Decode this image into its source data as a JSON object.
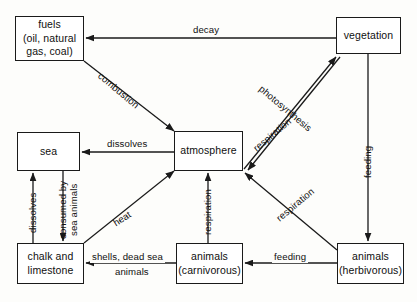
{
  "diagram": {
    "background_color": "#fdfdfb",
    "line_color": "#1a1a1a",
    "nodes": [
      {
        "id": "fuels",
        "lines": [
          "fuels",
          "(oil, natural",
          "gas, coal)"
        ],
        "x": 15,
        "y": 16,
        "w": 69,
        "h": 45
      },
      {
        "id": "vegetation",
        "lines": [
          "vegetation"
        ],
        "x": 336,
        "y": 17,
        "w": 65,
        "h": 37
      },
      {
        "id": "sea",
        "lines": [
          "sea"
        ],
        "x": 17,
        "y": 132,
        "w": 63,
        "h": 39
      },
      {
        "id": "atmosphere",
        "lines": [
          "atmosphere"
        ],
        "x": 174,
        "y": 131,
        "w": 69,
        "h": 40
      },
      {
        "id": "chalk-and-limestone",
        "lines": [
          "chalk and",
          "limestone"
        ],
        "x": 17,
        "y": 243,
        "w": 67,
        "h": 41
      },
      {
        "id": "animals-carnivorous",
        "lines": [
          "animals",
          "(carnivorous)"
        ],
        "x": 176,
        "y": 243,
        "w": 67,
        "h": 41
      },
      {
        "id": "animals-herbivorous",
        "lines": [
          "animals",
          "(herbivorous)"
        ],
        "x": 337,
        "y": 243,
        "w": 67,
        "h": 41
      }
    ],
    "edges": [
      {
        "id": "decay",
        "label": "decay",
        "from": "vegetation",
        "to": "fuels"
      },
      {
        "id": "combustion",
        "label": "combustion",
        "from": "fuels",
        "to": "atmosphere"
      },
      {
        "id": "respiration-vegetation",
        "label": "respiration",
        "from": "atmosphere",
        "to": "vegetation"
      },
      {
        "id": "photosynthesis",
        "label": "photosynthesis",
        "from": "vegetation",
        "to": "atmosphere"
      },
      {
        "id": "feeding-vegetation",
        "label": "feeding",
        "from": "vegetation",
        "to": "animals-herbivorous"
      },
      {
        "id": "dissolves-atmosphere-sea",
        "label": "dissolves",
        "from": "atmosphere",
        "to": "sea"
      },
      {
        "id": "dissolves-chalk-sea",
        "label": "dissolves",
        "from": "chalk-and-limestone",
        "to": "sea"
      },
      {
        "id": "consumed-by-sea-animals",
        "label": "consumed by sea animals",
        "from": "sea",
        "to": "chalk-and-limestone"
      },
      {
        "id": "heat",
        "label": "heat",
        "from": "chalk-and-limestone",
        "to": "atmosphere"
      },
      {
        "id": "respiration-carnivorous",
        "label": "respiration",
        "from": "animals-carnivorous",
        "to": "atmosphere"
      },
      {
        "id": "respiration-herbivorous",
        "label": "respiration",
        "from": "animals-herbivorous",
        "to": "atmosphere"
      },
      {
        "id": "shells-dead-sea-animals",
        "label": "shells, dead sea animals",
        "from": "animals-carnivorous",
        "to": "chalk-and-limestone"
      },
      {
        "id": "feeding-herbivorous",
        "label": "feeding",
        "from": "animals-herbivorous",
        "to": "animals-carnivorous"
      }
    ],
    "labels": {
      "decay": "decay",
      "combustion": "combustion",
      "respiration_top": "respiration",
      "photosynthesis": "photosynthesis",
      "feeding_right": "feeding",
      "dissolves_top": "dissolves",
      "dissolves_left": "dissolves",
      "consumed_line1": "consumed by",
      "consumed_line2": "sea animals",
      "heat": "heat",
      "respiration_mid": "respiration",
      "respiration_lower": "respiration",
      "shells_line1": "shells, dead sea",
      "shells_line2": "animals",
      "feeding_bottom": "feeding"
    }
  }
}
